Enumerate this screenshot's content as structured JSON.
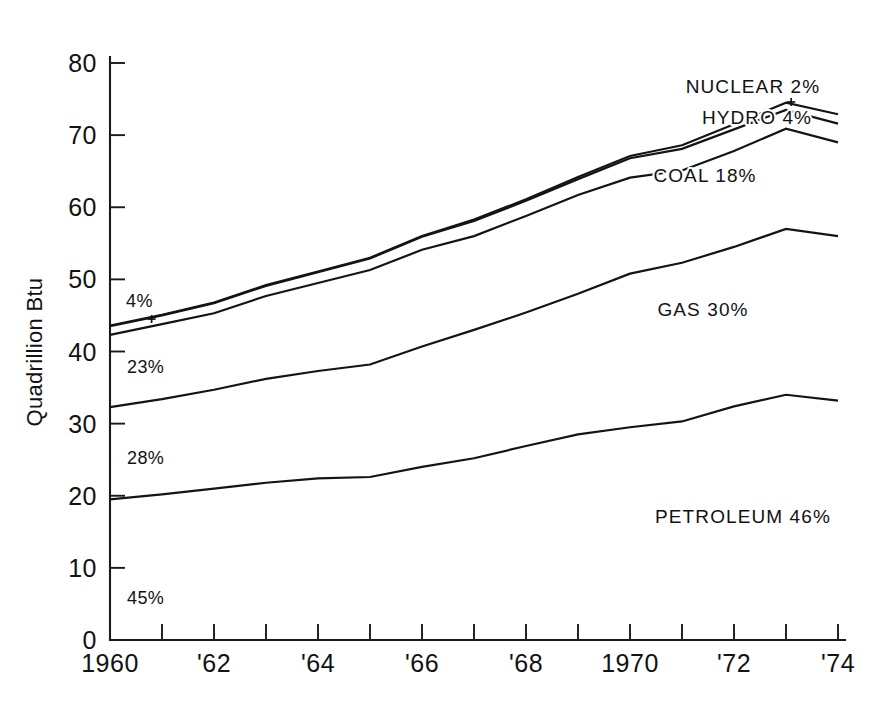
{
  "chart_data": {
    "type": "line",
    "title": "",
    "subtitle": "",
    "xlabel": "",
    "ylabel": "Quadrillion Btu",
    "xlim": [
      1960,
      1974
    ],
    "ylim": [
      0,
      80
    ],
    "grid": false,
    "legend_position": "inline-annotations",
    "stacked": true,
    "x": [
      1960,
      1961,
      1962,
      1963,
      1964,
      1965,
      1966,
      1967,
      1968,
      1969,
      1970,
      1971,
      1972,
      1973,
      1974
    ],
    "y_ticks": [
      0,
      10,
      20,
      30,
      40,
      50,
      60,
      70,
      80
    ],
    "y_tick_labels": [
      "0",
      "10",
      "20",
      "30",
      "40",
      "50",
      "60",
      "70",
      "80"
    ],
    "x_ticks": [
      1960,
      1961,
      1962,
      1963,
      1964,
      1965,
      1966,
      1967,
      1968,
      1969,
      1970,
      1971,
      1972,
      1973,
      1974
    ],
    "x_tick_labels": [
      "1960",
      "",
      "'62",
      "",
      "'64",
      "",
      "'66",
      "",
      "'68",
      "",
      "1970",
      "",
      "'72",
      "",
      "'74"
    ],
    "series": [
      {
        "name": "PETROLEUM",
        "share_label": "PETROLEUM 46%",
        "share_1974": "46%",
        "share_1960": "45%",
        "cumulative_values": [
          19.5,
          20.2,
          21.0,
          21.8,
          22.4,
          22.6,
          24.0,
          25.2,
          26.9,
          28.5,
          29.5,
          30.3,
          32.4,
          34.0,
          33.2
        ]
      },
      {
        "name": "GAS",
        "share_label": "GAS 30%",
        "share_1974": "30%",
        "share_1960": "28%",
        "cumulative_values": [
          32.3,
          33.4,
          34.7,
          36.2,
          37.3,
          38.2,
          40.7,
          43.0,
          45.4,
          48.0,
          50.8,
          52.3,
          54.5,
          57.0,
          56.0
        ]
      },
      {
        "name": "COAL",
        "share_label": "COAL 18%",
        "share_1974": "18%",
        "share_1960": "23%",
        "cumulative_values": [
          42.3,
          43.8,
          45.3,
          47.7,
          49.5,
          51.3,
          54.1,
          56.0,
          58.8,
          61.7,
          64.1,
          65.1,
          67.8,
          70.9,
          69.0
        ]
      },
      {
        "name": "HYDRO",
        "share_label": "HYDRO 4%",
        "share_1974": "4%",
        "share_1960": "4%",
        "cumulative_values": [
          43.5,
          45.0,
          46.7,
          49.1,
          51.0,
          52.9,
          55.9,
          58.1,
          60.9,
          63.9,
          66.8,
          68.1,
          70.8,
          73.5,
          71.6
        ]
      },
      {
        "name": "NUCLEAR",
        "share_label": "NUCLEAR 2%",
        "share_1974": "2%",
        "share_1960": "",
        "cumulative_values": [
          43.6,
          45.1,
          46.8,
          49.2,
          51.1,
          53.0,
          56.0,
          58.3,
          61.1,
          64.2,
          67.1,
          68.6,
          71.5,
          74.5,
          72.9
        ]
      }
    ],
    "annotations": [
      {
        "id": "nuclear-label",
        "text": "NUCLEAR 2%",
        "x_px": 753,
        "y_px": 93
      },
      {
        "id": "hydro-label",
        "text": "HYDRO 4%",
        "x_px": 757,
        "y_px": 124
      },
      {
        "id": "coal-label",
        "text": "COAL 18%",
        "x_px": 705,
        "y_px": 182
      },
      {
        "id": "gas-label",
        "text": "GAS 30%",
        "x_px": 703,
        "y_px": 316
      },
      {
        "id": "petroleum-label",
        "text": "PETROLEUM 46%",
        "x_px": 743,
        "y_px": 523
      },
      {
        "id": "share-hydro-1960",
        "text": "4%",
        "x_px": 126,
        "y_px": 307
      },
      {
        "id": "share-coal-1960",
        "text": "23%",
        "x_px": 127,
        "y_px": 373
      },
      {
        "id": "share-gas-1960",
        "text": "28%",
        "x_px": 127,
        "y_px": 464
      },
      {
        "id": "share-petroleum-1960",
        "text": "45%",
        "x_px": 127,
        "y_px": 604
      }
    ]
  },
  "axis": {
    "y_title": "Quadrillion Btu"
  }
}
